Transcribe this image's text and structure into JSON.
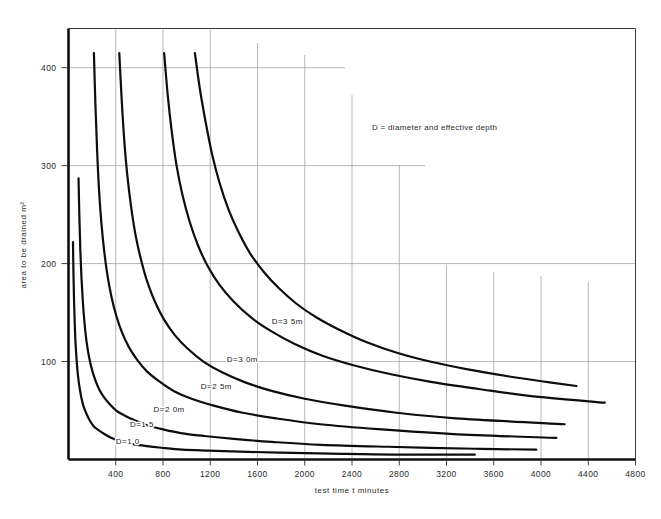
{
  "chart_data": {
    "type": "line",
    "title": "",
    "xlabel": "test time t minutes",
    "ylabel": "area to be drained  m²",
    "xlim": [
      0,
      4800
    ],
    "ylim": [
      0,
      440
    ],
    "grid": true,
    "legend_position": "inline-curve-labels",
    "annotation": "D = diameter and effective depth",
    "xticks": [
      400,
      800,
      1200,
      1600,
      2000,
      2400,
      2800,
      3200,
      3600,
      4000,
      4400,
      4800
    ],
    "xtick_labels": [
      "400",
      "800",
      "1200",
      "1600",
      "2000",
      "2400",
      "2800",
      "3200",
      "3600",
      "4000",
      "4400",
      "4800"
    ],
    "yticks": [
      100,
      200,
      300,
      400
    ],
    "ytick_labels": [
      "100",
      "200",
      "300",
      "400"
    ],
    "series": [
      {
        "name": "D = 3·5 m",
        "label": "D=3 5m",
        "label_x": 1720,
        "label_y": 138,
        "points": [
          [
            1070,
            415
          ],
          [
            1110,
            380
          ],
          [
            1160,
            345
          ],
          [
            1215,
            312
          ],
          [
            1280,
            282
          ],
          [
            1355,
            255
          ],
          [
            1440,
            232
          ],
          [
            1540,
            210
          ],
          [
            1650,
            192
          ],
          [
            1780,
            175
          ],
          [
            1930,
            159
          ],
          [
            2100,
            145
          ],
          [
            2300,
            132
          ],
          [
            2520,
            120
          ],
          [
            2780,
            109
          ],
          [
            3060,
            100
          ],
          [
            3380,
            92
          ],
          [
            3720,
            85
          ],
          [
            4060,
            79
          ],
          [
            4300,
            75
          ]
        ]
      },
      {
        "name": "D = 3·0 m",
        "label": "D=3 0m",
        "label_x": 1340,
        "label_y": 100,
        "points": [
          [
            810,
            415
          ],
          [
            840,
            372
          ],
          [
            875,
            334
          ],
          [
            915,
            300
          ],
          [
            965,
            270
          ],
          [
            1025,
            243
          ],
          [
            1095,
            219
          ],
          [
            1180,
            197
          ],
          [
            1280,
            178
          ],
          [
            1400,
            161
          ],
          [
            1545,
            145
          ],
          [
            1715,
            131
          ],
          [
            1915,
            118
          ],
          [
            2150,
            106
          ],
          [
            2420,
            96
          ],
          [
            2730,
            87
          ],
          [
            3080,
            79
          ],
          [
            3470,
            72
          ],
          [
            3900,
            65
          ],
          [
            4540,
            58
          ]
        ]
      },
      {
        "name": "D = 2·5 m",
        "label": "D=2 5m",
        "label_x": 1120,
        "label_y": 72,
        "points": [
          [
            430,
            415
          ],
          [
            450,
            368
          ],
          [
            472,
            326
          ],
          [
            498,
            290
          ],
          [
            530,
            258
          ],
          [
            568,
            229
          ],
          [
            614,
            204
          ],
          [
            668,
            181
          ],
          [
            732,
            161
          ],
          [
            808,
            143
          ],
          [
            900,
            127
          ],
          [
            1010,
            113
          ],
          [
            1142,
            100
          ],
          [
            1300,
            89
          ],
          [
            1490,
            79
          ],
          [
            1720,
            70
          ],
          [
            2000,
            62
          ],
          [
            2340,
            55
          ],
          [
            2760,
            48
          ],
          [
            3280,
            42
          ],
          [
            4200,
            36
          ]
        ]
      },
      {
        "name": "D = 2·0 m",
        "label": "D=2 0m",
        "label_x": 720,
        "label_y": 48,
        "points": [
          [
            215,
            415
          ],
          [
            228,
            362
          ],
          [
            242,
            316
          ],
          [
            258,
            276
          ],
          [
            278,
            242
          ],
          [
            302,
            213
          ],
          [
            330,
            188
          ],
          [
            364,
            166
          ],
          [
            404,
            147
          ],
          [
            452,
            130
          ],
          [
            510,
            115
          ],
          [
            580,
            102
          ],
          [
            664,
            90
          ],
          [
            766,
            80
          ],
          [
            890,
            70
          ],
          [
            1042,
            62
          ],
          [
            1230,
            55
          ],
          [
            1464,
            48
          ],
          [
            1756,
            42
          ],
          [
            2130,
            36
          ],
          [
            2620,
            31
          ],
          [
            3260,
            26
          ],
          [
            4130,
            22
          ]
        ]
      },
      {
        "name": "D = 1·5 m",
        "label": "D=1 5",
        "label_x": 520,
        "label_y": 33,
        "points": [
          [
            85,
            287
          ],
          [
            92,
            248
          ],
          [
            100,
            214
          ],
          [
            110,
            185
          ],
          [
            122,
            160
          ],
          [
            136,
            139
          ],
          [
            152,
            121
          ],
          [
            172,
            106
          ],
          [
            196,
            93
          ],
          [
            224,
            82
          ],
          [
            258,
            72
          ],
          [
            298,
            64
          ],
          [
            346,
            57
          ],
          [
            404,
            50
          ],
          [
            474,
            45
          ],
          [
            560,
            40
          ],
          [
            664,
            35
          ],
          [
            792,
            31
          ],
          [
            950,
            27
          ],
          [
            1150,
            24
          ],
          [
            1400,
            21
          ],
          [
            1720,
            18
          ],
          [
            2140,
            15
          ],
          [
            2700,
            13
          ],
          [
            3440,
            11
          ],
          [
            3960,
            10
          ]
        ]
      },
      {
        "name": "D = 1·0 m",
        "label": "D=1 0",
        "label_x": 400,
        "label_y": 16,
        "points": [
          [
            38,
            222
          ],
          [
            42,
            190
          ],
          [
            47,
            162
          ],
          [
            53,
            138
          ],
          [
            60,
            118
          ],
          [
            69,
            101
          ],
          [
            80,
            86
          ],
          [
            93,
            74
          ],
          [
            109,
            63
          ],
          [
            128,
            54
          ],
          [
            151,
            47
          ],
          [
            179,
            40
          ],
          [
            213,
            34
          ],
          [
            254,
            30
          ],
          [
            304,
            26
          ],
          [
            365,
            22
          ],
          [
            440,
            19
          ],
          [
            532,
            16
          ],
          [
            646,
            14
          ],
          [
            788,
            12
          ],
          [
            964,
            10
          ],
          [
            1182,
            9
          ],
          [
            1450,
            8
          ],
          [
            1790,
            7
          ],
          [
            2220,
            6
          ],
          [
            2760,
            5
          ],
          [
            3440,
            5
          ]
        ]
      }
    ]
  },
  "axis": {
    "x_title": "test time t minutes",
    "y_title": "area to be drained  m²"
  },
  "annotation": {
    "text": "D = diameter and effective depth"
  }
}
